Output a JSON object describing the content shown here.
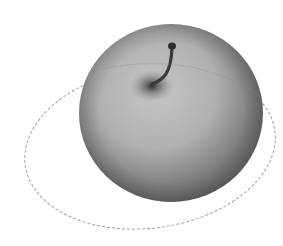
{
  "image": {
    "subject": "apple",
    "description": "Grayscale shaded apple with a stem, encircled by a tilted dotted orbit ellipse",
    "colors": {
      "background": "#ffffff",
      "apple_light": "#c4c4c4",
      "apple_mid": "#9a9a9a",
      "apple_dark": "#5e5e5e",
      "stem": "#3a3a3a",
      "orbit": "#9c9c9c"
    }
  }
}
